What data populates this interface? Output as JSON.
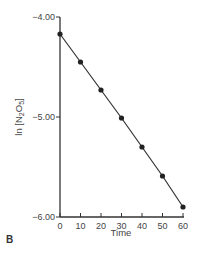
{
  "chart_data": {
    "type": "line",
    "title": "",
    "panel_label": "B",
    "xlabel": "Time",
    "ylabel": "ln [N2O5]",
    "ylabel_parts": {
      "pre": "ln [N",
      "sub1": "2",
      "mid": "O",
      "sub2": "5",
      "post": "]"
    },
    "xlim": [
      0,
      60
    ],
    "ylim": [
      -6.0,
      -4.0
    ],
    "x_ticks": [
      0,
      10,
      20,
      30,
      40,
      50,
      60
    ],
    "x_tick_labels": [
      "0",
      "10",
      "20",
      "30",
      "40",
      "50",
      "60"
    ],
    "y_ticks": [
      -4.0,
      -5.0,
      -6.0
    ],
    "y_tick_labels": [
      "−4.00",
      "−5.00",
      "−6.00"
    ],
    "grid": false,
    "series": [
      {
        "name": "ln [N2O5]",
        "x": [
          0,
          10,
          20,
          30,
          40,
          50,
          60
        ],
        "values": [
          -4.17,
          -4.45,
          -4.73,
          -5.01,
          -5.3,
          -5.59,
          -5.9
        ],
        "color": "#333333",
        "marker": "circle"
      }
    ]
  }
}
